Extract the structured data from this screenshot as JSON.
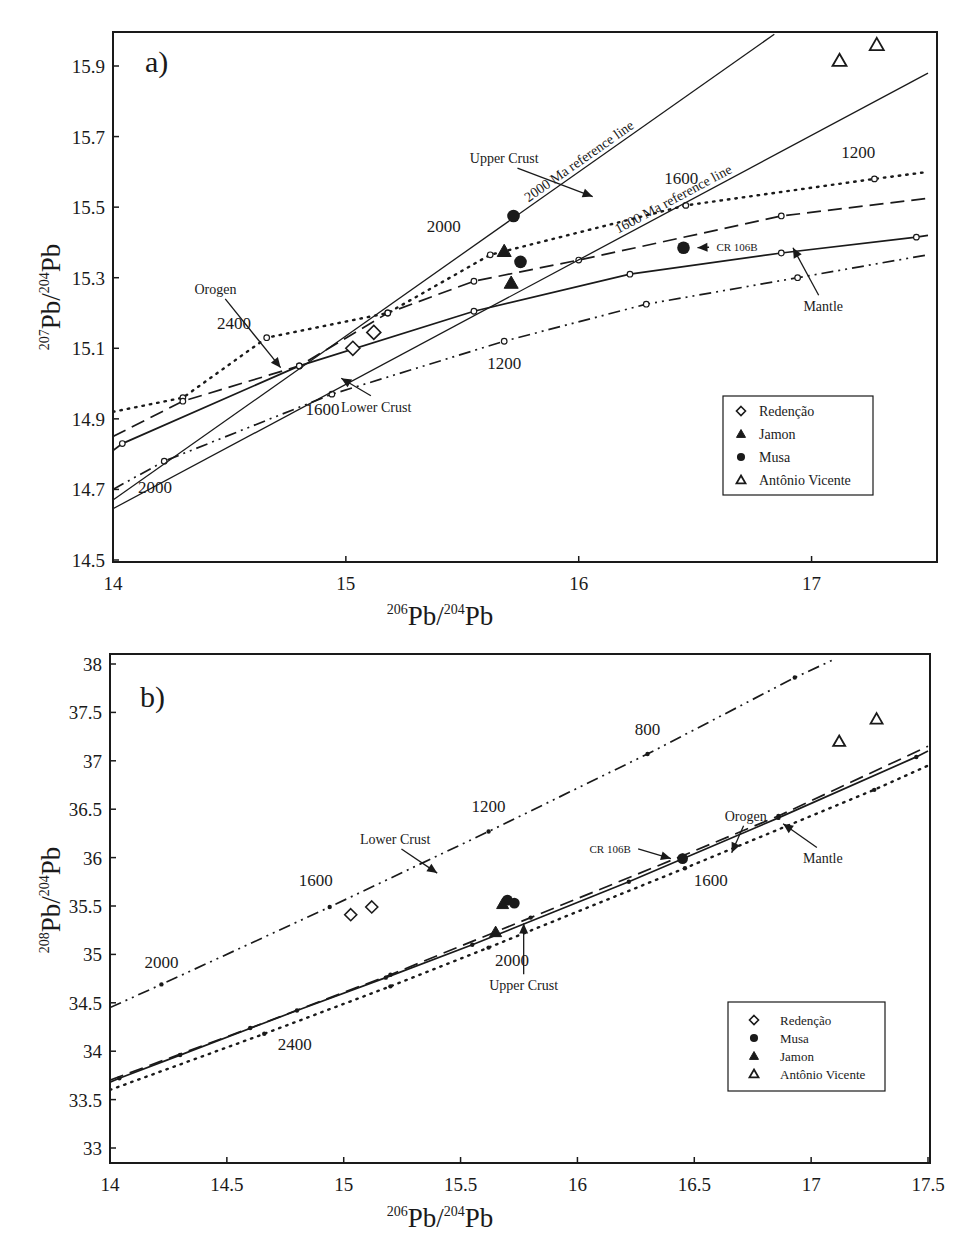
{
  "chart_data": [
    {
      "panel": "a)",
      "type": "scatter",
      "title": "",
      "xlabel": {
        "sup": "206",
        "base": "Pb/",
        "sup2": "204",
        "base2": "Pb"
      },
      "ylabel": {
        "sup": "207",
        "base": "Pb/",
        "sup2": "204",
        "base2": "Pb"
      },
      "xlim": [
        14,
        17.5
      ],
      "ylim": [
        14.5,
        16.0
      ],
      "xticks": [
        14,
        15,
        16,
        17
      ],
      "yticks": [
        14.5,
        14.7,
        14.9,
        15.1,
        15.3,
        15.5,
        15.7,
        15.9
      ],
      "grid": false,
      "legend_position": "lower right",
      "legend": [
        {
          "label": "Redenção",
          "marker": "open-diamond"
        },
        {
          "label": "Jamon",
          "marker": "filled-triangle"
        },
        {
          "label": "Musa",
          "marker": "filled-circle"
        },
        {
          "label": "Antônio Vicente",
          "marker": "open-triangle"
        }
      ],
      "series": [
        {
          "name": "Redenção",
          "marker": "open-diamond",
          "points": [
            [
              15.03,
              15.1
            ],
            [
              15.12,
              15.145
            ]
          ]
        },
        {
          "name": "Jamon",
          "marker": "filled-triangle",
          "points": [
            [
              15.68,
              15.375
            ],
            [
              15.71,
              15.285
            ]
          ]
        },
        {
          "name": "Musa",
          "marker": "filled-circle",
          "points": [
            [
              15.72,
              15.475
            ],
            [
              15.75,
              15.345
            ],
            [
              16.45,
              15.385
            ]
          ]
        },
        {
          "name": "Antônio Vicente",
          "marker": "open-triangle",
          "points": [
            [
              17.12,
              15.915
            ],
            [
              17.28,
              15.96
            ]
          ]
        }
      ],
      "curves": [
        {
          "name": "Upper Crust",
          "style": "dotted",
          "points": [
            [
              14.0,
              14.92
            ],
            [
              14.3,
              14.96
            ],
            [
              14.66,
              15.13
            ],
            [
              15.18,
              15.2
            ],
            [
              15.62,
              15.365
            ],
            [
              16.46,
              15.505
            ],
            [
              17.27,
              15.58
            ],
            [
              17.5,
              15.6
            ]
          ]
        },
        {
          "name": "Orogen",
          "style": "dashed",
          "points": [
            [
              14.0,
              14.85
            ],
            [
              14.3,
              14.95
            ],
            [
              14.8,
              15.05
            ],
            [
              15.18,
              15.2
            ],
            [
              15.55,
              15.29
            ],
            [
              16.0,
              15.35
            ],
            [
              16.87,
              15.475
            ],
            [
              17.5,
              15.525
            ]
          ]
        },
        {
          "name": "Mantle",
          "style": "solid",
          "points": [
            [
              14.0,
              14.81
            ],
            [
              14.04,
              14.83
            ],
            [
              14.8,
              15.05
            ],
            [
              15.55,
              15.205
            ],
            [
              16.22,
              15.31
            ],
            [
              16.87,
              15.37
            ],
            [
              17.45,
              15.415
            ],
            [
              17.5,
              15.42
            ]
          ]
        },
        {
          "name": "Lower Crust",
          "style": "dash-dot-dot",
          "points": [
            [
              14.0,
              14.7
            ],
            [
              14.22,
              14.78
            ],
            [
              14.94,
              14.97
            ],
            [
              15.68,
              15.12
            ],
            [
              16.29,
              15.225
            ],
            [
              16.94,
              15.3
            ],
            [
              17.5,
              15.365
            ]
          ]
        },
        {
          "name": "2000 Ma reference line",
          "style": "solid-thin",
          "points": [
            [
              14.0,
              14.67
            ],
            [
              16.84,
              15.99
            ]
          ]
        },
        {
          "name": "1600 Ma reference line",
          "style": "solid-thin",
          "points": [
            [
              14.0,
              14.645
            ],
            [
              17.5,
              15.88
            ]
          ]
        }
      ],
      "age_labels": [
        {
          "text": "2400",
          "x": 14.52,
          "y": 15.155
        },
        {
          "text": "2000",
          "x": 15.42,
          "y": 15.43
        },
        {
          "text": "1600",
          "x": 16.44,
          "y": 15.565
        },
        {
          "text": "1200",
          "x": 17.2,
          "y": 15.64
        },
        {
          "text": "1600",
          "x": 14.9,
          "y": 14.91
        },
        {
          "text": "1200",
          "x": 15.68,
          "y": 15.04
        },
        {
          "text": "2000",
          "x": 14.18,
          "y": 14.69
        }
      ],
      "annotations": [
        {
          "text": "Orogen",
          "label_xy": [
            14.44,
            15.254
          ],
          "arrow_to": [
            14.72,
            15.045
          ]
        },
        {
          "text": "Upper Crust",
          "label_xy": [
            15.68,
            15.625
          ],
          "arrow_to": [
            16.06,
            15.53
          ]
        },
        {
          "text": "Lower Crust",
          "label_xy": [
            15.13,
            14.92
          ],
          "arrow_to": [
            14.98,
            15.015
          ]
        },
        {
          "text": "Mantle",
          "label_xy": [
            17.05,
            15.205
          ],
          "arrow_to": [
            16.92,
            15.385
          ]
        },
        {
          "text": "CR 106B",
          "label_xy": [
            16.68,
            15.375
          ],
          "arrow_to": [
            16.51,
            15.385
          ]
        },
        {
          "text": "2000 Ma reference line",
          "rotated": true
        },
        {
          "text": "1600 Ma reference line",
          "rotated": true
        }
      ]
    },
    {
      "panel": "b)",
      "type": "scatter",
      "title": "",
      "xlabel": {
        "sup": "206",
        "base": "Pb/",
        "sup2": "204",
        "base2": "Pb"
      },
      "ylabel": {
        "sup": "208",
        "base": "Pb/",
        "sup2": "204",
        "base2": "Pb"
      },
      "xlim": [
        14,
        17.5
      ],
      "ylim": [
        33,
        38.1
      ],
      "xticks": [
        14,
        14.5,
        15,
        15.5,
        16,
        16.5,
        17,
        17.5
      ],
      "yticks": [
        33,
        33.5,
        34,
        34.5,
        35,
        35.5,
        36,
        36.5,
        37,
        37.5,
        38
      ],
      "grid": false,
      "legend_position": "lower right",
      "legend": [
        {
          "label": "Redenção",
          "marker": "open-diamond"
        },
        {
          "label": "Musa",
          "marker": "filled-circle"
        },
        {
          "label": "Jamon",
          "marker": "filled-triangle"
        },
        {
          "label": "Antônio Vicente",
          "marker": "open-triangle"
        }
      ],
      "series": [
        {
          "name": "Redenção",
          "marker": "open-diamond",
          "points": [
            [
              15.03,
              35.41
            ],
            [
              15.12,
              35.49
            ]
          ]
        },
        {
          "name": "Musa",
          "marker": "filled-circle",
          "points": [
            [
              15.7,
              35.56
            ],
            [
              15.73,
              35.53
            ],
            [
              16.45,
              35.99
            ]
          ]
        },
        {
          "name": "Jamon",
          "marker": "filled-triangle",
          "points": [
            [
              15.68,
              35.52
            ],
            [
              15.65,
              35.23
            ]
          ]
        },
        {
          "name": "Antônio Vicente",
          "marker": "open-triangle",
          "points": [
            [
              17.12,
              37.2
            ],
            [
              17.28,
              37.43
            ]
          ]
        }
      ],
      "curves": [
        {
          "name": "Lower Crust",
          "style": "dash-dot-dot",
          "points": [
            [
              14.0,
              34.45
            ],
            [
              14.22,
              34.69
            ],
            [
              14.94,
              35.49
            ],
            [
              15.62,
              36.27
            ],
            [
              16.3,
              37.07
            ],
            [
              16.93,
              37.86
            ],
            [
              17.1,
              38.05
            ]
          ]
        },
        {
          "name": "Orogen",
          "style": "dashed",
          "points": [
            [
              14.0,
              33.7
            ],
            [
              14.6,
              34.24
            ],
            [
              15.2,
              34.79
            ],
            [
              15.8,
              35.38
            ],
            [
              16.45,
              36.02
            ],
            [
              16.86,
              36.43
            ],
            [
              17.5,
              37.15
            ]
          ]
        },
        {
          "name": "Mantle",
          "style": "solid",
          "points": [
            [
              14.0,
              33.68
            ],
            [
              14.04,
              33.72
            ],
            [
              14.3,
              33.96
            ],
            [
              14.8,
              34.42
            ],
            [
              15.18,
              34.76
            ],
            [
              15.55,
              35.1
            ],
            [
              16.22,
              35.75
            ],
            [
              16.86,
              36.41
            ],
            [
              17.45,
              37.04
            ],
            [
              17.5,
              37.1
            ]
          ]
        },
        {
          "name": "Upper Crust",
          "style": "dotted",
          "points": [
            [
              14.0,
              33.6
            ],
            [
              14.66,
              34.18
            ],
            [
              15.2,
              34.67
            ],
            [
              15.62,
              35.07
            ],
            [
              16.46,
              35.89
            ],
            [
              17.27,
              36.7
            ],
            [
              17.5,
              36.95
            ]
          ]
        }
      ],
      "age_labels": [
        {
          "text": "2000",
          "x": 14.22,
          "y": 34.86
        },
        {
          "text": "1600",
          "x": 14.88,
          "y": 35.71
        },
        {
          "text": "1200",
          "x": 15.62,
          "y": 36.47
        },
        {
          "text": "800",
          "x": 16.3,
          "y": 37.27
        },
        {
          "text": "2400",
          "x": 14.79,
          "y": 34.01
        },
        {
          "text": "2000",
          "x": 15.72,
          "y": 34.88
        },
        {
          "text": "1600",
          "x": 16.57,
          "y": 35.71
        }
      ],
      "annotations": [
        {
          "text": "Lower Crust",
          "label_xy": [
            15.22,
            36.14
          ],
          "arrow_to": [
            15.4,
            35.84
          ]
        },
        {
          "text": "Orogen",
          "label_xy": [
            16.72,
            36.38
          ],
          "arrow_to": [
            16.66,
            36.05
          ]
        },
        {
          "text": "Mantle",
          "label_xy": [
            17.05,
            35.94
          ],
          "arrow_to": [
            16.88,
            36.35
          ]
        },
        {
          "text": "Upper Crust",
          "label_xy": [
            15.77,
            34.63
          ],
          "arrow_to": [
            15.77,
            35.32
          ]
        },
        {
          "text": "CR 106B",
          "label_xy": [
            16.14,
            36.05
          ],
          "arrow_to": [
            16.4,
            35.99
          ]
        }
      ]
    }
  ]
}
